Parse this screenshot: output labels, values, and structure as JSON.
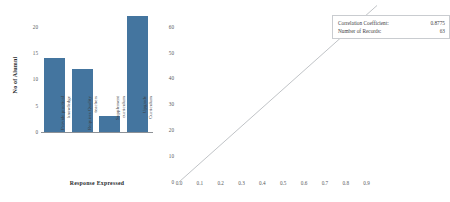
{
  "chart_data": [
    {
      "type": "bar",
      "title": "",
      "xlabel": "Response Expressed",
      "ylabel": "No of Alumni",
      "categories": [
        "Provide practical knowledge",
        "Requires Quality teachers",
        "Supplement curriculum",
        "Upgrade Curriculum"
      ],
      "values": [
        14,
        12,
        3,
        22
      ],
      "ylim": [
        0,
        22.8
      ],
      "yticks": [
        0,
        5,
        10,
        15,
        20
      ],
      "grid": false,
      "bar_color": "#44759f",
      "legend": "none"
    },
    {
      "type": "line",
      "title": "",
      "xlabel": "",
      "ylabel": "",
      "x": [
        0.0,
        0.8775
      ],
      "y": [
        0.0,
        63
      ],
      "xlim": [
        0.0,
        0.95
      ],
      "ylim": [
        0,
        68
      ],
      "xticks": [
        "0.0",
        "0.1",
        "0.2",
        "0.3",
        "0.4",
        "0.5",
        "0.6",
        "0.7",
        "0.8",
        "0.9"
      ],
      "yticks": [
        "0",
        "10",
        "20",
        "30",
        "40",
        "50",
        "60"
      ],
      "grid": false,
      "line_color": "#b9bcc0",
      "marker": {
        "x": 0.8775,
        "y": 63,
        "shape": "square"
      },
      "annotation": {
        "correlation_label": "Correlation Coefficient:",
        "correlation_value": "0.8775",
        "records_label": "Number of Records:",
        "records_value": "63"
      },
      "legend": "none"
    }
  ],
  "bar_chart": {
    "ylabel": "No of Alumni",
    "xlabel": "Response Expressed",
    "yticks": [
      "0",
      "5",
      "10",
      "15",
      "20"
    ],
    "bars": [
      {
        "label": "Provide practical\nknowledge",
        "value": 14
      },
      {
        "label": "Requires Quality\nteachers",
        "value": 12
      },
      {
        "label": "Supplement\ncurriculum",
        "value": 3
      },
      {
        "label": "Upgrade\nCurriculum",
        "value": 22
      }
    ]
  },
  "line_chart": {
    "yticks": [
      "0",
      "10",
      "20",
      "30",
      "40",
      "50",
      "60"
    ],
    "xticks": [
      "0.0",
      "0.1",
      "0.2",
      "0.3",
      "0.4",
      "0.5",
      "0.6",
      "0.7",
      "0.8",
      "0.9"
    ],
    "annotation": {
      "correlation_label": "Correlation Coefficient:",
      "correlation_value": "0.8775",
      "records_label": "Number of Records:",
      "records_value": "63"
    }
  }
}
